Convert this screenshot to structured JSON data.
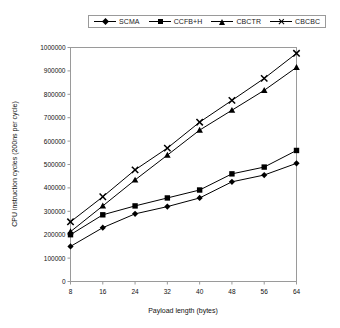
{
  "chart_data": {
    "type": "line",
    "title": "",
    "xlabel": "Payload length (bytes)",
    "ylabel": "CPU instruction cycles (200ns per cycle)",
    "x": [
      8,
      16,
      24,
      32,
      40,
      48,
      56,
      64
    ],
    "xlim": [
      8,
      64
    ],
    "ylim": [
      0,
      1000000
    ],
    "ytick_labels": [
      "0",
      "100000",
      "200000",
      "300000",
      "400000",
      "500000",
      "600000",
      "700000",
      "800000",
      "900000",
      "1000000"
    ],
    "yticks": [
      0,
      100000,
      200000,
      300000,
      400000,
      500000,
      600000,
      700000,
      800000,
      900000,
      1000000
    ],
    "xtick_labels": [
      "8",
      "16",
      "24",
      "32",
      "40",
      "48",
      "56",
      "64"
    ],
    "grid": false,
    "legend_position": "top",
    "series": [
      {
        "name": "SCMA",
        "marker": "diamond",
        "values": [
          150000,
          230000,
          289000,
          320000,
          357000,
          426000,
          455000,
          505000
        ]
      },
      {
        "name": "CCFB+H",
        "marker": "square",
        "values": [
          200000,
          285000,
          323000,
          357000,
          391000,
          460000,
          489000,
          560000
        ]
      },
      {
        "name": "CBCTR",
        "marker": "triangle",
        "values": [
          213000,
          323000,
          434000,
          540000,
          647000,
          732000,
          817000,
          915000
        ]
      },
      {
        "name": "CBCBC",
        "marker": "cross",
        "values": [
          255000,
          362000,
          477000,
          570000,
          681000,
          774000,
          868000,
          975000
        ]
      }
    ]
  },
  "legend": {
    "items": [
      {
        "label": "SCMA",
        "marker": "diamond"
      },
      {
        "label": "CCFB+H",
        "marker": "square"
      },
      {
        "label": "CBCTR",
        "marker": "triangle"
      },
      {
        "label": "CBCBC",
        "marker": "cross"
      }
    ]
  },
  "colors": {
    "series": "#000000",
    "axis": "#9a9a9a",
    "text": "#111111",
    "background": "#ffffff"
  }
}
